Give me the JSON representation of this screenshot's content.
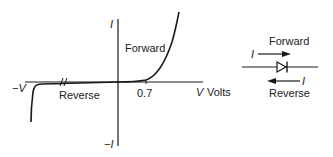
{
  "graph": {
    "y_axis_top_label": "I",
    "y_axis_bottom_label": "−I",
    "x_axis_left_label": "−V",
    "x_axis_right_label_var": "V",
    "x_axis_right_label_unit": "Volts",
    "forward_label": "Forward",
    "reverse_label": "Reverse",
    "threshold_tick_label": "0.7"
  },
  "symbol": {
    "forward_label": "Forward",
    "reverse_label": "Reverse",
    "forward_current_label": "I",
    "reverse_current_label": "I"
  },
  "colors": {
    "line": "#1a1a1a",
    "text": "#222222",
    "background": "#ffffff"
  }
}
